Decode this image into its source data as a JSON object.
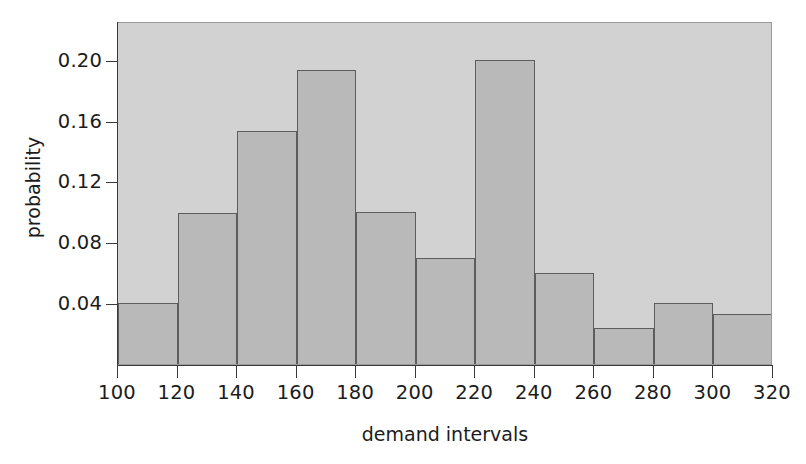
{
  "chart_data": {
    "type": "bar",
    "title": "",
    "subtitle": "",
    "xlabel": "demand intervals",
    "ylabel": "probability",
    "grid": false,
    "legend": null,
    "legend_position": "none",
    "xlim": [
      100,
      320
    ],
    "ylim": [
      0,
      0.2255
    ],
    "bin_width": 20,
    "bin_edges": [
      100,
      120,
      140,
      160,
      180,
      200,
      220,
      240,
      260,
      280,
      300,
      320
    ],
    "categories": [
      "100-120",
      "120-140",
      "140-160",
      "160-180",
      "180-200",
      "200-220",
      "220-240",
      "240-260",
      "260-280",
      "280-300",
      "300-320"
    ],
    "values": [
      0.04,
      0.099,
      0.153,
      0.193,
      0.1,
      0.07,
      0.2,
      0.06,
      0.024,
      0.04,
      0.033
    ],
    "xticks": [
      100,
      120,
      140,
      160,
      180,
      200,
      220,
      240,
      260,
      280,
      300,
      320
    ],
    "xtick_labels": [
      "100",
      "120",
      "140",
      "160",
      "180",
      "200",
      "220",
      "240",
      "260",
      "280",
      "300",
      "320"
    ],
    "yticks": [
      0.04,
      0.08,
      0.12,
      0.16,
      0.2
    ],
    "ytick_labels": [
      "0.04",
      "0.08",
      "0.12",
      "0.16",
      "0.20"
    ],
    "colors": {
      "plot_background": "#d2d2d2",
      "bar_fill": "#b9b9b9",
      "bar_edge": "#5d5d5d",
      "axis": "#3a3a3a",
      "text": "#1c1c1c",
      "figure_background": "#ffffff"
    }
  }
}
